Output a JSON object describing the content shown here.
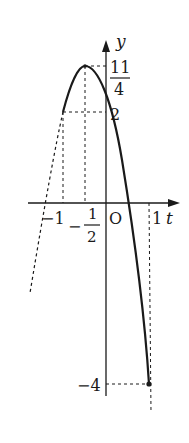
{
  "figure": {
    "function": "f(t) = -3t^2 - 3t + 2",
    "solid_domain": [
      -1,
      1
    ],
    "axes": {
      "x_label": "t",
      "y_label": "y",
      "origin_label": "O"
    },
    "x_ticks": [
      {
        "value": -1,
        "label": "−1"
      },
      {
        "value": -0.5,
        "label_num": "1",
        "label_den": "2",
        "sign": "−"
      },
      {
        "value": 1,
        "label": "1"
      }
    ],
    "y_ticks": [
      {
        "value": 2.75,
        "label_num": "11",
        "label_den": "4"
      },
      {
        "value": 2,
        "label": "2"
      },
      {
        "value": -4,
        "label": "−4"
      }
    ],
    "key_points": [
      {
        "name": "vertex",
        "t": -0.5,
        "y": 2.75
      },
      {
        "name": "left-endpoint",
        "t": -1,
        "y": 2
      },
      {
        "name": "y-intercept",
        "t": 0,
        "y": 2
      },
      {
        "name": "right-endpoint",
        "t": 1,
        "y": -4
      }
    ],
    "colors": {
      "ink": "#1a1a1a",
      "background": "#ffffff"
    }
  }
}
